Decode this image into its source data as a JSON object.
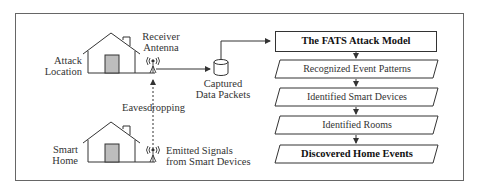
{
  "diagram": {
    "left": {
      "attack_location": [
        "Attack",
        "Location"
      ],
      "receiver_antenna": [
        "Receiver",
        "Antenna"
      ],
      "captured_data_packets": [
        "Captured",
        "Data Packets"
      ],
      "eavesdropping": "Eavesdropping",
      "smart_home": [
        "Smart",
        "Home"
      ],
      "emitted_signals": [
        "Emitted Signals",
        "from Smart Devices"
      ]
    },
    "pipeline": [
      {
        "label": "The FATS Attack Model",
        "shape": "rectangle",
        "bold": true
      },
      {
        "label": "Recognized Event Patterns",
        "shape": "parallelogram",
        "bold": false
      },
      {
        "label": "Identified Smart Devices",
        "shape": "parallelogram",
        "bold": false
      },
      {
        "label": "Identified Rooms",
        "shape": "parallelogram",
        "bold": false
      },
      {
        "label": "Discovered Home Events",
        "shape": "parallelogram",
        "bold": true
      }
    ],
    "colors": {
      "line": "#333333",
      "frame": "#555555",
      "door_fill": "#bdbdbd",
      "background": "#ffffff"
    }
  }
}
